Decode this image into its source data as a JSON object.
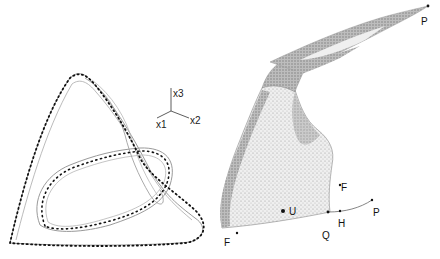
{
  "figure": {
    "left_panel": {
      "description": "Closed orbit with surrounding tube-like manifold (wireframe), dotted trajectory",
      "axes": {
        "x1": "x1",
        "x2": "x2",
        "x3": "x3"
      }
    },
    "right_panel": {
      "description": "Stippled surface (2D manifold) with labeled points",
      "labels": {
        "P_top": "P",
        "P_right": "P",
        "F_upper": "F",
        "F_lower": "F",
        "U": "U",
        "H": "H",
        "Q": "Q"
      }
    },
    "colors": {
      "trajectory_dots": "#111111",
      "manifold_lines": "#888888",
      "surface_fill": "#c8c8c8",
      "surface_dark": "#8a8a8a"
    }
  }
}
